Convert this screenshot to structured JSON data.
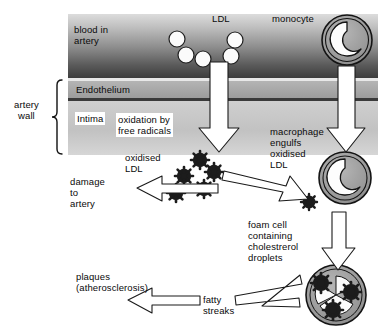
{
  "diagram": {
    "colors": {
      "blood_band_dark": "#4a4a4a",
      "blood_band_light": "#d8d8d8",
      "endothelium": "#a8a8a8",
      "intima": "#c4c4c4",
      "cell_fill": "#9a9a9a",
      "cell_outline": "#1a1a1a",
      "ldl_fill": "#ffffff",
      "oxidised_ldl": "#1c1c1c",
      "arrow_fill": "#ffffff",
      "arrow_outline": "#1a1a1a",
      "text": "#0a0a0a"
    },
    "labels": {
      "blood_in_artery": "blood in\nartery",
      "ldl_top": "LDL",
      "monocyte": "monocyte",
      "artery_wall": "artery\nwall",
      "endothelium": "Endothelium",
      "intima": "Intima",
      "oxidation_by_free_radicals": "oxidation by\nfree radicals",
      "oxidised_ldl": "oxidised\nLDL",
      "macrophage_engulfs": "macrophage\nengulfs\noxidised\nLDL",
      "damage_to_artery": "damage\nto\nartery",
      "foam_cell": "foam cell\ncontaining\ncholestrerol\ndroplets",
      "plaques": "plaques\n(atherosclerosis)",
      "fatty_streaks": "fatty\nstreaks"
    },
    "ldl_particles": [
      {
        "cx": 177,
        "cy": 39,
        "r": 8
      },
      {
        "cx": 186,
        "cy": 55,
        "r": 8
      },
      {
        "cx": 203,
        "cy": 59,
        "r": 8
      },
      {
        "cx": 235,
        "cy": 40,
        "r": 8
      },
      {
        "cx": 231,
        "cy": 56,
        "r": 8
      }
    ],
    "oxidised_ldl_particles": [
      {
        "cx": 200,
        "cy": 160,
        "r": 9
      },
      {
        "cx": 214,
        "cy": 172,
        "r": 9
      },
      {
        "cx": 184,
        "cy": 176,
        "r": 9
      },
      {
        "cx": 204,
        "cy": 189,
        "r": 9
      },
      {
        "cx": 176,
        "cy": 193,
        "r": 9
      },
      {
        "cx": 309,
        "cy": 202,
        "r": 8
      }
    ],
    "cells": [
      {
        "name": "monocyte",
        "cx": 347,
        "cy": 40,
        "r": 25
      },
      {
        "name": "macrophage",
        "cx": 345,
        "cy": 178,
        "r": 26
      },
      {
        "name": "foam-cell",
        "cx": 336,
        "cy": 295,
        "r": 30
      }
    ],
    "bands": {
      "left": 68,
      "right": 378,
      "blood_top": 14,
      "blood_bottom": 78,
      "endothelium_top": 81,
      "endothelium_bottom": 98,
      "intima_top": 101,
      "intima_bottom": 155
    }
  }
}
